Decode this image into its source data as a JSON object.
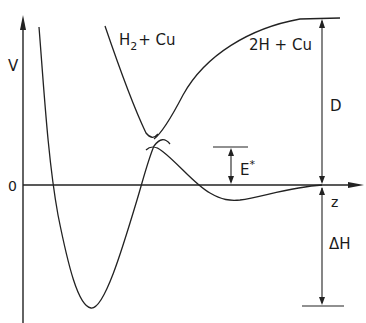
{
  "diagram": {
    "axes": {
      "y_label": "V",
      "x_label": "z",
      "zero_label": "0"
    },
    "curves": {
      "molecular": {
        "label": "H",
        "label_sub": "2",
        "label_rest": "+ Cu"
      },
      "atomic": {
        "label": "2H + Cu"
      }
    },
    "annotations": {
      "activation_barrier": {
        "label": "E",
        "label_sup": "*"
      },
      "dissociation_energy": {
        "label": "D"
      },
      "enthalpy": {
        "label": "ΔH"
      }
    },
    "colors": {
      "line": "#222222",
      "background": "#ffffff"
    }
  }
}
